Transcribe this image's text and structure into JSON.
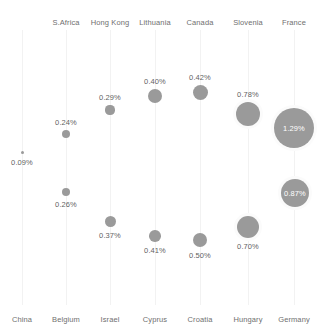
{
  "chart_data": {
    "type": "scatter",
    "title": "",
    "subtitle": "",
    "xlabel": "",
    "ylabel": "",
    "grid": true,
    "legend": "none",
    "note": "Bubble chart: 13 countries arranged in 7 vertical column lanes; bubble area encodes the percentage value; labels above or below the bubble, or inside for the largest bubbles.",
    "bubble_color": "#9a9a9a",
    "columns": [
      {
        "index": 0,
        "top_label": "",
        "bottom_label": "China"
      },
      {
        "index": 1,
        "top_label": "S.Africa",
        "bottom_label": "Belgium"
      },
      {
        "index": 2,
        "top_label": "Hong Kong",
        "bottom_label": "Israel"
      },
      {
        "index": 3,
        "top_label": "Lithuania",
        "bottom_label": "Cyprus"
      },
      {
        "index": 4,
        "top_label": "Canada",
        "bottom_label": "Croatia"
      },
      {
        "index": 5,
        "top_label": "Slovenia",
        "bottom_label": "Hungary"
      },
      {
        "index": 6,
        "top_label": "France",
        "bottom_label": "Germany"
      }
    ],
    "categories": [
      "China",
      "S.Africa",
      "Belgium",
      "Hong Kong",
      "Israel",
      "Lithuania",
      "Cyprus",
      "Canada",
      "Croatia",
      "Slovenia",
      "Hungary",
      "France",
      "Germany"
    ],
    "values": [
      0.09,
      0.24,
      0.26,
      0.29,
      0.37,
      0.4,
      0.41,
      0.42,
      0.5,
      0.78,
      0.7,
      1.29,
      0.87
    ],
    "value_labels": [
      "0.09%",
      "0.24%",
      "0.26%",
      "0.29%",
      "0.37%",
      "0.40%",
      "0.41%",
      "0.42%",
      "0.50%",
      "0.78%",
      "0.70%",
      "1.29%",
      "0.87%"
    ],
    "points": [
      {
        "name": "China",
        "label": "0.09%",
        "value": 0.09,
        "cx": 22,
        "cy": 152,
        "r": 1.5,
        "label_pos": "below",
        "label_inside": false
      },
      {
        "name": "S.Africa",
        "label": "0.24%",
        "value": 0.24,
        "cx": 66,
        "cy": 134,
        "r": 4.0,
        "label_pos": "above",
        "label_inside": false
      },
      {
        "name": "Belgium",
        "label": "0.26%",
        "value": 0.26,
        "cx": 66,
        "cy": 192,
        "r": 4.2,
        "label_pos": "below",
        "label_inside": false
      },
      {
        "name": "Hong Kong",
        "label": "0.29%",
        "value": 0.29,
        "cx": 110,
        "cy": 110,
        "r": 4.6,
        "label_pos": "above",
        "label_inside": false
      },
      {
        "name": "Israel",
        "label": "0.37%",
        "value": 0.37,
        "cx": 110,
        "cy": 221,
        "r": 5.5,
        "label_pos": "below",
        "label_inside": false
      },
      {
        "name": "Lithuania",
        "label": "0.40%",
        "value": 0.4,
        "cx": 155,
        "cy": 96,
        "r": 7.0,
        "label_pos": "above",
        "label_inside": false
      },
      {
        "name": "Cyprus",
        "label": "0.41%",
        "value": 0.41,
        "cx": 155,
        "cy": 236,
        "r": 5.8,
        "label_pos": "below",
        "label_inside": false
      },
      {
        "name": "Canada",
        "label": "0.42%",
        "value": 0.42,
        "cx": 200,
        "cy": 92,
        "r": 7.5,
        "label_pos": "above",
        "label_inside": false
      },
      {
        "name": "Croatia",
        "label": "0.50%",
        "value": 0.5,
        "cx": 200,
        "cy": 240,
        "r": 7.0,
        "label_pos": "below",
        "label_inside": false
      },
      {
        "name": "Slovenia",
        "label": "0.78%",
        "value": 0.78,
        "cx": 248,
        "cy": 114,
        "r": 12.0,
        "label_pos": "above",
        "label_inside": false
      },
      {
        "name": "Hungary",
        "label": "0.70%",
        "value": 0.7,
        "cx": 248,
        "cy": 227,
        "r": 11.0,
        "label_pos": "below",
        "label_inside": false
      },
      {
        "name": "France",
        "label": "1.29%",
        "value": 1.29,
        "cx": 294,
        "cy": 128,
        "r": 20.0,
        "label_pos": "center",
        "label_inside": true
      },
      {
        "name": "Germany",
        "label": "0.87%",
        "value": 0.87,
        "cx": 295,
        "cy": 193,
        "r": 14.0,
        "label_pos": "center",
        "label_inside": true
      }
    ],
    "gridlines_x": [
      22,
      66,
      110,
      155,
      200,
      248,
      294
    ],
    "grid_top": 30,
    "grid_bottom": 305
  }
}
